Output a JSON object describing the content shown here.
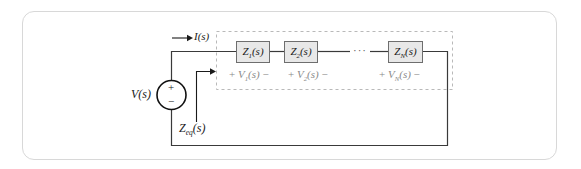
{
  "figure": {
    "type": "circuit-diagram"
  },
  "source": {
    "label": "V(s)",
    "plus": "+",
    "minus": "−",
    "symbol": "voltage-source-circle"
  },
  "current": {
    "label_prefix": "I",
    "label_arg": "(s)",
    "label": "I(s)",
    "arrow": "right"
  },
  "equivalent": {
    "label_z": "Z",
    "label_sub": "eq",
    "label_arg": "(s)",
    "label": "Z_eq(s)",
    "arrow": "pointer-into-network"
  },
  "network": {
    "dashed_box": true,
    "ellipsis": "···",
    "elements": [
      {
        "box_label_z": "Z",
        "box_label_sub": "1",
        "box_label_arg": "(s)",
        "box_label": "Z₁(s)",
        "volt_plus": "+",
        "volt_label_v": "V",
        "volt_label_sub": "1",
        "volt_label_arg": "(s)",
        "volt_label": "V₁(s)",
        "volt_minus": "−"
      },
      {
        "box_label_z": "Z",
        "box_label_sub": "2",
        "box_label_arg": "(s)",
        "box_label": "Z₂(s)",
        "volt_plus": "+",
        "volt_label_v": "V",
        "volt_label_sub": "2",
        "volt_label_arg": "(s)",
        "volt_label": "V₂(s)",
        "volt_minus": "−"
      },
      {
        "box_label_z": "Z",
        "box_label_sub": "N",
        "box_label_arg": "(s)",
        "box_label": "Zₙ(s)",
        "volt_plus": "+",
        "volt_label_v": "V",
        "volt_label_sub": "N",
        "volt_label_arg": "(s)",
        "volt_label": "Vₙ(s)",
        "volt_minus": "−"
      }
    ]
  },
  "colors": {
    "frame_border": "#d8d8d8",
    "wire": "#3a3a3a",
    "box_fill": "#e8e8e8",
    "box_border": "#6e6e6e",
    "dashed_border": "#b9b9b9",
    "label_dark": "#1a1a1a",
    "label_gray": "#8a8a8a",
    "background": "#ffffff"
  }
}
